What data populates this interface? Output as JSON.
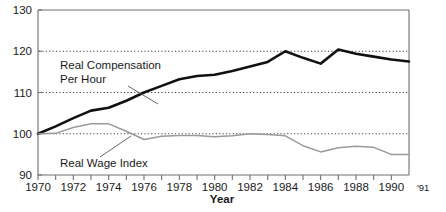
{
  "chart_data": {
    "type": "line",
    "title": "",
    "xlabel": "Year",
    "ylabel": "",
    "xlim": [
      1970,
      1991
    ],
    "ylim": [
      90,
      130
    ],
    "grid": "horizontal-dotted",
    "gridlines": [
      100,
      110,
      120
    ],
    "legend_position": "inline-annotations",
    "y_ticks": [
      "130",
      "120",
      "110",
      "100",
      "90"
    ],
    "y_tick_values": [
      130,
      120,
      110,
      100,
      90
    ],
    "x_ticks": [
      "1970",
      "1972",
      "1974",
      "1976",
      "1978",
      "1980",
      "1982",
      "1984",
      "1986",
      "1988",
      "1990",
      "'91"
    ],
    "x_tick_values": [
      1970,
      1972,
      1974,
      1976,
      1978,
      1980,
      1982,
      1984,
      1986,
      1988,
      1990,
      1991
    ],
    "x_minor_ticks": [
      1971,
      1973,
      1975,
      1977,
      1979,
      1981,
      1983,
      1985,
      1987,
      1989
    ],
    "x": [
      1970,
      1971,
      1972,
      1973,
      1974,
      1975,
      1976,
      1977,
      1978,
      1979,
      1980,
      1981,
      1982,
      1983,
      1984,
      1985,
      1986,
      1987,
      1988,
      1989,
      1990,
      1991
    ],
    "series": [
      {
        "name": "Real Compensation Per Hour",
        "color": "#111111",
        "width": 2.6,
        "values": [
          100.0,
          101.8,
          103.8,
          105.6,
          106.3,
          108.0,
          110.0,
          111.6,
          113.2,
          114.0,
          114.3,
          115.2,
          116.3,
          117.4,
          120.0,
          118.4,
          117.0,
          120.4,
          119.4,
          118.7,
          118.0,
          117.5
        ]
      },
      {
        "name": "Real Wage Index",
        "color": "#9a9a9a",
        "width": 1.5,
        "values": [
          100.0,
          100.1,
          101.5,
          102.4,
          102.4,
          100.6,
          98.6,
          99.4,
          99.6,
          99.6,
          99.3,
          99.5,
          100.0,
          99.8,
          99.5,
          97.1,
          95.6,
          96.6,
          97.0,
          96.7,
          95.0,
          95.0
        ]
      }
    ],
    "annotations": [
      {
        "id": "real-compensation-annotation",
        "line1": "Real Compensation",
        "line2": "Per Hour",
        "text_x": 60,
        "text_y1": 69,
        "text_y2": 83,
        "leader": {
          "x1": 128,
          "y1": 86,
          "x2": 158,
          "y2": 104
        }
      },
      {
        "id": "real-wage-annotation",
        "line1": "Real Wage Index",
        "line2": "",
        "text_x": 60,
        "text_y1": 167,
        "text_y2": 0,
        "leader": {
          "x1": 100,
          "y1": 157,
          "x2": 131,
          "y2": 136
        }
      }
    ],
    "axis_color": "#6f6f6f",
    "grid_color": "#333333",
    "background": "#ffffff"
  }
}
